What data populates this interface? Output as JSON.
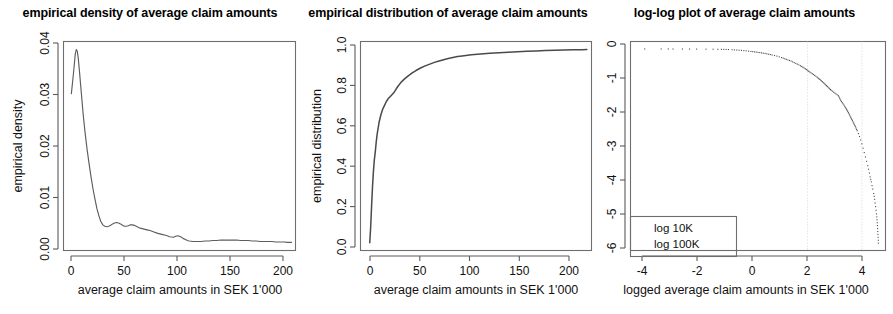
{
  "figure": {
    "width": 893,
    "height": 314,
    "background": "#ffffff",
    "foreground": "#000000",
    "curve_color": "#5d5d5d",
    "refline_color": "#c9c9c9"
  },
  "panels": [
    {
      "id": "density",
      "title": "empirical density of average claim amounts",
      "xlabel": "average claim amounts in SEK 1'000",
      "ylabel": "empirical density",
      "xticks": [
        "0",
        "50",
        "100",
        "150",
        "200"
      ],
      "yticks": [
        "0.00",
        "0.01",
        "0.02",
        "0.03",
        "0.04"
      ]
    },
    {
      "id": "ecdf",
      "title": "empirical distribution of average claim amounts",
      "xlabel": "average claim amounts in SEK 1'000",
      "ylabel": "empirical distribution",
      "xticks": [
        "0",
        "50",
        "100",
        "150",
        "200"
      ],
      "yticks": [
        "0.0",
        "0.2",
        "0.4",
        "0.6",
        "0.8",
        "1.0"
      ]
    },
    {
      "id": "loglog",
      "title": "log-log plot of average claim amounts",
      "xlabel": "logged average claim amounts in SEK 1'000",
      "ylabel": "logged survival probability",
      "xticks": [
        "-4",
        "-2",
        "0",
        "2",
        "4"
      ],
      "yticks": [
        "0",
        "-1",
        "-2",
        "-3",
        "-4",
        "-5",
        "-6"
      ],
      "legend": [
        "log 10K",
        "log 100K"
      ]
    }
  ],
  "chart_data": [
    {
      "type": "line",
      "id": "density",
      "title": "empirical density of average claim amounts",
      "xlabel": "average claim amounts in SEK 1'000",
      "ylabel": "empirical density",
      "xlim": [
        -8,
        228
      ],
      "ylim": [
        -0.0015,
        0.0425
      ],
      "xticks": [
        0,
        50,
        100,
        150,
        200
      ],
      "yticks": [
        0.0,
        0.01,
        0.02,
        0.03,
        0.04
      ],
      "grid": false,
      "legend": null,
      "series": [
        {
          "name": "kernel density of average claim amounts",
          "x": [
            0,
            2,
            4,
            5,
            6,
            7,
            8,
            10,
            12,
            14,
            16,
            18,
            20,
            22,
            24,
            26,
            28,
            30,
            32,
            34,
            36,
            38,
            40,
            42,
            44,
            46,
            48,
            50,
            52,
            54,
            56,
            58,
            60,
            62,
            64,
            66,
            68,
            70,
            72,
            74,
            76,
            78,
            80,
            84,
            88,
            92,
            96,
            100,
            104,
            106,
            108,
            110,
            112,
            114,
            116,
            118,
            120,
            124,
            128,
            132,
            136,
            140,
            144,
            148,
            152,
            156,
            160,
            164,
            168,
            172,
            176,
            180,
            184,
            188,
            192,
            196,
            200,
            204,
            208,
            212,
            216,
            220,
            224
          ],
          "y": [
            0.0315,
            0.0355,
            0.0399,
            0.0408,
            0.0405,
            0.039,
            0.0368,
            0.032,
            0.0272,
            0.0232,
            0.0198,
            0.0168,
            0.014,
            0.0115,
            0.0093,
            0.0073,
            0.0058,
            0.0046,
            0.0039,
            0.0036,
            0.0035,
            0.0036,
            0.0038,
            0.0041,
            0.0043,
            0.0044,
            0.0043,
            0.0041,
            0.0038,
            0.0036,
            0.0036,
            0.0037,
            0.0039,
            0.0039,
            0.0038,
            0.0036,
            0.0034,
            0.0032,
            0.0031,
            0.003,
            0.0029,
            0.0028,
            0.0027,
            0.0024,
            0.0021,
            0.0019,
            0.0017,
            0.0014,
            0.0013,
            0.0015,
            0.0016,
            0.0015,
            0.0013,
            0.001,
            0.0008,
            0.0006,
            0.0005,
            0.0004,
            0.0004,
            0.0004,
            0.0005,
            0.0005,
            0.0006,
            0.0006,
            0.0007,
            0.0007,
            0.0007,
            0.0007,
            0.0007,
            0.0006,
            0.0006,
            0.0006,
            0.0005,
            0.0005,
            0.0004,
            0.0004,
            0.0004,
            0.0004,
            0.0003,
            0.0003,
            0.0003,
            0.0002,
            0.0002
          ]
        }
      ]
    },
    {
      "type": "line",
      "id": "ecdf",
      "title": "empirical distribution of average claim amounts",
      "xlabel": "average claim amounts in SEK 1'000",
      "ylabel": "empirical distribution",
      "xlim": [
        -10,
        240
      ],
      "ylim": [
        -0.04,
        1.04
      ],
      "xticks": [
        0,
        50,
        100,
        150,
        200
      ],
      "yticks": [
        0.0,
        0.2,
        0.4,
        0.6,
        0.8,
        1.0
      ],
      "grid": false,
      "legend": null,
      "series": [
        {
          "name": "empirical distribution function",
          "x": [
            0,
            1,
            2,
            3,
            4,
            5,
            6,
            7,
            8,
            9,
            10,
            12,
            14,
            16,
            18,
            20,
            22,
            24,
            26,
            28,
            30,
            34,
            38,
            42,
            46,
            50,
            55,
            60,
            65,
            70,
            75,
            80,
            85,
            90,
            95,
            100,
            110,
            120,
            130,
            140,
            150,
            160,
            170,
            180,
            190,
            200,
            210,
            220,
            230,
            235
          ],
          "y": [
            0.0,
            0.08,
            0.19,
            0.29,
            0.37,
            0.43,
            0.47,
            0.52,
            0.56,
            0.59,
            0.62,
            0.66,
            0.69,
            0.71,
            0.73,
            0.745,
            0.755,
            0.765,
            0.775,
            0.79,
            0.805,
            0.83,
            0.848,
            0.864,
            0.878,
            0.89,
            0.903,
            0.914,
            0.923,
            0.932,
            0.939,
            0.946,
            0.952,
            0.957,
            0.962,
            0.965,
            0.971,
            0.975,
            0.979,
            0.982,
            0.985,
            0.987,
            0.989,
            0.991,
            0.993,
            0.995,
            0.996,
            0.997,
            0.998,
            0.999
          ]
        }
      ]
    },
    {
      "type": "scatter",
      "id": "loglog",
      "title": "log-log plot of average claim amounts",
      "xlabel": "logged average claim amounts in SEK 1'000",
      "ylabel": "logged survival probability",
      "xlim": [
        -5.2,
        5.6
      ],
      "ylim": [
        -6.9,
        0.25
      ],
      "xticks": [
        -4,
        -2,
        0,
        2,
        4
      ],
      "yticks": [
        0,
        -1,
        -2,
        -3,
        -4,
        -5,
        -6
      ],
      "grid": false,
      "legend": [
        "log 10K",
        "log 100K"
      ],
      "reference_lines": [
        {
          "label": "log 10K",
          "x": 2.3
        },
        {
          "label": "log 100K",
          "x": 4.6
        }
      ],
      "series": [
        {
          "name": "logged survival probability vs logged average claim amount",
          "x": [
            -4.6,
            -3.9,
            -3.6,
            -3.4,
            -3.0,
            -2.7,
            -2.4,
            -2.0,
            -1.7,
            -1.5,
            -1.35,
            -1.25,
            -1.15,
            -1.05,
            -0.9,
            -0.7,
            -0.5,
            -0.3,
            -0.1,
            0.2,
            0.5,
            0.8,
            1.0,
            1.2,
            1.4,
            1.6,
            1.8,
            2.0,
            2.2,
            2.4,
            2.55,
            2.7,
            2.85,
            3.0,
            3.1,
            3.2,
            3.3,
            3.4,
            3.5,
            3.6,
            3.65,
            3.7,
            3.8,
            3.9,
            4.0,
            4.1,
            4.2,
            4.3,
            4.4,
            4.5,
            4.55,
            4.6,
            4.65,
            4.7,
            4.75,
            4.8,
            4.85,
            4.88,
            4.92,
            4.95,
            5.0,
            5.03,
            5.06,
            5.1,
            5.14,
            5.18,
            5.22,
            5.25,
            5.28,
            5.3
          ],
          "y": [
            -0.005,
            -0.005,
            -0.006,
            -0.007,
            -0.008,
            -0.009,
            -0.01,
            -0.012,
            -0.014,
            -0.016,
            -0.018,
            -0.02,
            -0.022,
            -0.025,
            -0.032,
            -0.042,
            -0.055,
            -0.07,
            -0.09,
            -0.12,
            -0.16,
            -0.21,
            -0.25,
            -0.3,
            -0.36,
            -0.42,
            -0.5,
            -0.58,
            -0.68,
            -0.8,
            -0.88,
            -0.97,
            -1.07,
            -1.18,
            -1.26,
            -1.34,
            -1.42,
            -1.48,
            -1.54,
            -1.6,
            -1.68,
            -1.76,
            -1.88,
            -2.0,
            -2.14,
            -2.3,
            -2.46,
            -2.62,
            -2.8,
            -3.0,
            -3.12,
            -3.25,
            -3.4,
            -3.55,
            -3.7,
            -3.85,
            -4.0,
            -4.12,
            -4.25,
            -4.38,
            -4.55,
            -4.68,
            -4.8,
            -4.95,
            -5.15,
            -5.4,
            -5.65,
            -5.95,
            -6.35,
            -6.65
          ]
        }
      ]
    }
  ]
}
